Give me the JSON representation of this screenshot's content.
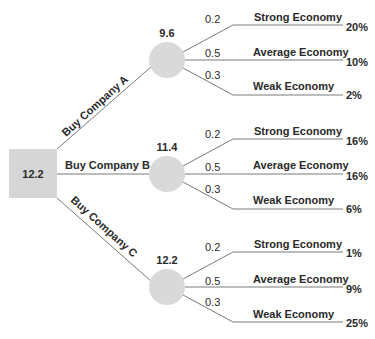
{
  "decision_node": {
    "value": "12.2",
    "color": "#d6d6d6"
  },
  "line_color": "#7a7a7a",
  "chance_color": "#d9d9d9",
  "options": [
    {
      "label": "Buy Company A",
      "value": "9.6",
      "outcomes": [
        {
          "prob": "0.2",
          "label": "Strong Economy",
          "payoff": "20%"
        },
        {
          "prob": "0.5",
          "label": "Average Economy",
          "payoff": "10%"
        },
        {
          "prob": "0.3",
          "label": "Weak Economy",
          "payoff": "2%"
        }
      ]
    },
    {
      "label": "Buy Company B",
      "value": "11.4",
      "outcomes": [
        {
          "prob": "0.2",
          "label": "Strong Economy",
          "payoff": "8%"
        },
        {
          "prob": "0.5",
          "label": "Average Economy",
          "payoff": "16%"
        },
        {
          "prob": "0.3",
          "label": "Weak Economy",
          "payoff": "6%"
        }
      ]
    },
    {
      "label": "Buy Company C",
      "value": "12.2",
      "outcomes": [
        {
          "prob": "0.2",
          "label": "Strong Economy",
          "payoff": "1%"
        },
        {
          "prob": "0.5",
          "label": "Average Economy",
          "payoff": "9%"
        },
        {
          "prob": "0.3",
          "label": "Weak Economy",
          "payoff": "25%"
        }
      ]
    }
  ]
}
